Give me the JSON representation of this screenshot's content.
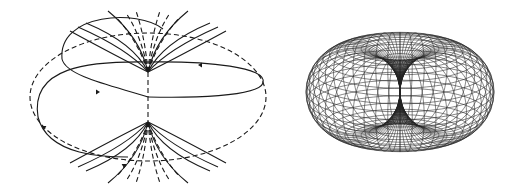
{
  "figures": [
    {
      "id": "field-lines",
      "description": "Dipole-like field lines: solid and dashed curves fanning from a central axis with two large horizontal loops and directional arrowheads",
      "line_styles": [
        "solid",
        "dashed"
      ],
      "color": "#1a1a1a"
    },
    {
      "id": "torus-wireframe",
      "description": "Wireframe horn torus with pinched center channel",
      "color": "#222222"
    }
  ]
}
